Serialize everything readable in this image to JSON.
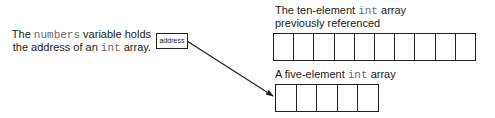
{
  "left_caption": {
    "line1": {
      "pre": "The ",
      "code": "numbers",
      "post": " variable holds"
    },
    "line2": {
      "pre": "the address of an ",
      "code": "int",
      "post": " array."
    }
  },
  "variable_box": {
    "value": "address"
  },
  "ten_array": {
    "label_line1": {
      "pre": "The ten-element ",
      "code": "int",
      "post": " array"
    },
    "label_line2": "previously referenced",
    "cell_count": 10
  },
  "five_array": {
    "label": {
      "pre": "A five-element ",
      "code": "int",
      "post": " array"
    },
    "cell_count": 5
  },
  "arrow": {
    "from": [
      187,
      41
    ],
    "to": [
      274,
      96
    ]
  },
  "colors": {
    "stroke": "#222222",
    "code_text": "#6a6a6a",
    "text": "#1a1a1a"
  }
}
